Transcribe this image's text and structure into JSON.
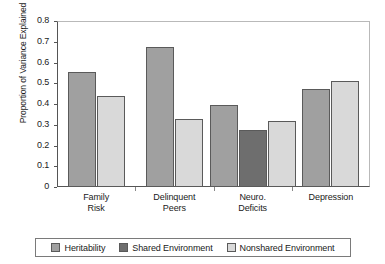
{
  "chart_data": {
    "type": "bar",
    "title": "",
    "xlabel": "",
    "ylabel": "Proportion of Variance Explained",
    "ylim": [
      0,
      0.8
    ],
    "yticks": [
      "0",
      "0.1",
      "0.2",
      "0.3",
      "0.4",
      "0.5",
      "0.6",
      "0.7",
      "0.8"
    ],
    "ytick_values": [
      0,
      0.1,
      0.2,
      0.3,
      0.4,
      0.5,
      0.6,
      0.7,
      0.8
    ],
    "grid": false,
    "legend_position": "bottom",
    "categories": [
      "Family Risk",
      "Delinquent Peers",
      "Neuro. Deficits",
      "Depression"
    ],
    "category_lines": [
      [
        "Family",
        "Risk"
      ],
      [
        "Delinquent",
        "Peers"
      ],
      [
        "Neuro.",
        "Deficits"
      ],
      [
        "Depression"
      ]
    ],
    "series": [
      {
        "name": "Heritability",
        "color": "#a0a0a0",
        "values": [
          0.555,
          0.675,
          0.397,
          0.472
        ]
      },
      {
        "name": "Shared Environment",
        "color": "#6e6e6e",
        "values": [
          null,
          null,
          0.276,
          null
        ]
      },
      {
        "name": "Nonshared Environment",
        "color": "#d9d9d9",
        "values": [
          0.437,
          0.328,
          0.32,
          0.513
        ]
      }
    ]
  },
  "legend": {
    "items": [
      {
        "label": "Heritability",
        "color": "#a0a0a0"
      },
      {
        "label": "Shared Environment",
        "color": "#6e6e6e"
      },
      {
        "label": "Nonshared Environment",
        "color": "#d9d9d9"
      }
    ]
  }
}
